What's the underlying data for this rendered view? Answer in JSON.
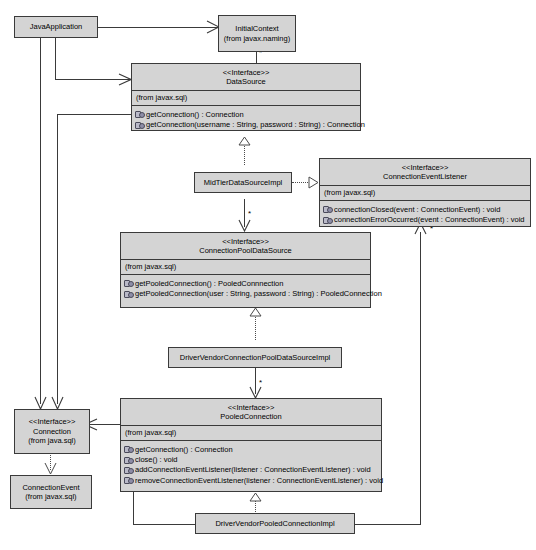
{
  "diagram": {
    "type": "uml-class-diagram",
    "stereotype_label": "<<Interface>>",
    "colors": {
      "box_fill": "#d4d4d4",
      "box_border": "#3a3a3a",
      "line": "#3a3a3a",
      "background": "#ffffff"
    }
  },
  "classes": {
    "java_application": {
      "name": "JavaApplication",
      "package": "",
      "stereotype": ""
    },
    "initial_context": {
      "name": "InitialContext",
      "package": "(from javax.naming)",
      "stereotype": ""
    },
    "data_source": {
      "stereotype": "<<Interface>>",
      "name": "DataSource",
      "package": "(from javax.sql)",
      "operations": [
        "getConnection() : Connection",
        "getConnection(username : String, password : String) : Connection"
      ]
    },
    "mid_tier_data_source_impl": {
      "name": "MidTierDataSourceImpl",
      "package": "",
      "stereotype": ""
    },
    "connection_event_listener": {
      "stereotype": "<<Interface>>",
      "name": "ConnectionEventListener",
      "package": "(from javax.sql)",
      "operations": [
        "connectionClosed(event : ConnectionEvent) : void",
        "connectionErrorOccurred(event : ConnectionEvent) : void"
      ]
    },
    "connection_pool_data_source": {
      "stereotype": "<<Interface>>",
      "name": "ConnectionPoolDataSource",
      "package": "(from javax.sql)",
      "operations": [
        "getPooledConnection() : PooledConnnection",
        "getPooledConnection(user : String, password : String) : PooledConnection"
      ]
    },
    "driver_vendor_cpds_impl": {
      "name": "DriverVendorConnectionPoolDataSourceImpl",
      "package": "",
      "stereotype": ""
    },
    "pooled_connection": {
      "stereotype": "<<Interface>>",
      "name": "PooledConnection",
      "package": "(from javax.sql)",
      "operations": [
        "getConnection() : Connection",
        "close() : void",
        "addConnectionEventListener(listener : ConnectionEventListener) : void",
        "removeConnectionEventListener(listener : ConnectionEventListener) : void"
      ]
    },
    "connection": {
      "stereotype": "<<Interface>>",
      "name": "Connection",
      "package": "(from java.sql)",
      "operations": []
    },
    "connection_event": {
      "name": "ConnectionEvent",
      "package": "(from javax.sql)",
      "stereotype": ""
    },
    "driver_vendor_pooled_connection_impl": {
      "name": "DriverVendorPooledConnectionImpl",
      "package": "",
      "stereotype": ""
    }
  },
  "multiplicities": {
    "initial_context_to_data_source": "*",
    "mid_tier_to_cpds": "*",
    "cpds_to_pooled_connection": "*",
    "pooled_connection_to_listener": "*",
    "listener_right": "*"
  },
  "relationships": [
    {
      "from": "JavaApplication",
      "to": "InitialContext",
      "kind": "association"
    },
    {
      "from": "JavaApplication",
      "to": "DataSource",
      "kind": "association"
    },
    {
      "from": "JavaApplication",
      "to": "Connection",
      "kind": "association"
    },
    {
      "from": "InitialContext",
      "to": "DataSource",
      "kind": "association",
      "multiplicity": "*"
    },
    {
      "from": "DataSource",
      "to": "Connection",
      "kind": "association"
    },
    {
      "from": "MidTierDataSourceImpl",
      "to": "DataSource",
      "kind": "realization"
    },
    {
      "from": "MidTierDataSourceImpl",
      "to": "ConnectionEventListener",
      "kind": "realization"
    },
    {
      "from": "MidTierDataSourceImpl",
      "to": "ConnectionPoolDataSource",
      "kind": "association",
      "multiplicity": "*"
    },
    {
      "from": "DriverVendorConnectionPoolDataSourceImpl",
      "to": "ConnectionPoolDataSource",
      "kind": "realization"
    },
    {
      "from": "DriverVendorConnectionPoolDataSourceImpl",
      "to": "PooledConnection",
      "kind": "association",
      "multiplicity": "*"
    },
    {
      "from": "DriverVendorPooledConnectionImpl",
      "to": "PooledConnection",
      "kind": "realization"
    },
    {
      "from": "PooledConnection",
      "to": "Connection",
      "kind": "association"
    },
    {
      "from": "Connection",
      "to": "ConnectionEvent",
      "kind": "dependency"
    },
    {
      "from": "DriverVendorPooledConnectionImpl",
      "to": "ConnectionEventListener",
      "kind": "association",
      "multiplicity": "*"
    }
  ]
}
